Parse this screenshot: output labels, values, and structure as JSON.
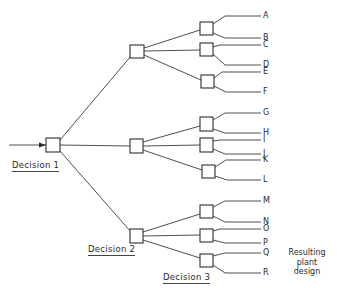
{
  "diagram": {
    "type": "decision-tree",
    "stage_labels": {
      "decision_1": "Decision 1",
      "decision_2": "Decision 2",
      "decision_3": "Decision 3"
    },
    "result_label": {
      "line1": "Resulting",
      "line2": "plant",
      "line3": "design"
    },
    "outcomes": [
      "A",
      "B",
      "C",
      "D",
      "E",
      "F",
      "G",
      "H",
      "I",
      "J",
      "K",
      "L",
      "M",
      "N",
      "O",
      "P",
      "Q",
      "R"
    ],
    "structure": {
      "root": "Decision 1",
      "children": [
        {
          "node": "Decision 2 (upper)",
          "children": [
            [
              "A",
              "B"
            ],
            [
              "C",
              "D"
            ],
            [
              "E",
              "F"
            ]
          ]
        },
        {
          "node": "Decision 2 (middle)",
          "children": [
            [
              "G",
              "H"
            ],
            [
              "I",
              "J"
            ],
            [
              "K",
              "L"
            ]
          ]
        },
        {
          "node": "Decision 2 (lower)",
          "children": [
            [
              "M",
              "N"
            ],
            [
              "O",
              "P"
            ],
            [
              "Q",
              "R"
            ]
          ]
        }
      ]
    },
    "colors": {
      "line": "#3a3a3a",
      "background": "#ffffff"
    }
  }
}
